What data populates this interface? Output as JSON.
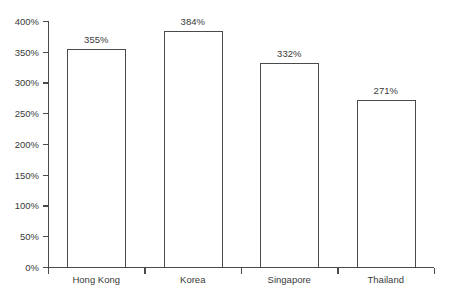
{
  "chart_data": {
    "type": "bar",
    "title": "",
    "subtitle": "",
    "xlabel": "",
    "ylabel": "",
    "categories": [
      "Hong Kong",
      "Korea",
      "Singapore",
      "Thailand"
    ],
    "values": [
      355,
      384,
      332,
      271
    ],
    "value_labels": [
      "355%",
      "384%",
      "332%",
      "271%"
    ],
    "ylim": [
      0,
      400
    ],
    "ytick_values": [
      0,
      50,
      100,
      150,
      200,
      250,
      300,
      350,
      400
    ],
    "ytick_labels": [
      "0%",
      "50%",
      "100%",
      "150%",
      "200%",
      "250%",
      "300%",
      "350%",
      "400%"
    ],
    "grid": false,
    "legend": false,
    "legend_position": "none",
    "orientation": "vertical",
    "bar_fill": "#ffffff",
    "bar_stroke": "#4a4a4a",
    "axis_color": "#4a4a4a",
    "text_color": "#3a3a3a",
    "background": "#ffffff"
  },
  "axes": {
    "y_axis_name": "percent-axis",
    "x_axis_name": "country-axis"
  }
}
